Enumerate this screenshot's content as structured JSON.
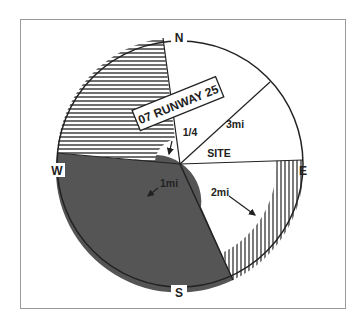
{
  "diagram": {
    "type": "wind-rose / approach sector diagram",
    "compass": {
      "north": "N",
      "east": "E",
      "south": "S",
      "west": "W"
    },
    "runway_label": "07 RUNWAY 25",
    "site_label": "SITE",
    "distance_labels": {
      "quarter": "1/4",
      "one": "1mi",
      "two": "2mi",
      "three": "3mi"
    },
    "colors": {
      "frame": "#9a9a9a",
      "outline": "#222222",
      "dark_sector": "#555555",
      "background": "#ffffff"
    }
  }
}
